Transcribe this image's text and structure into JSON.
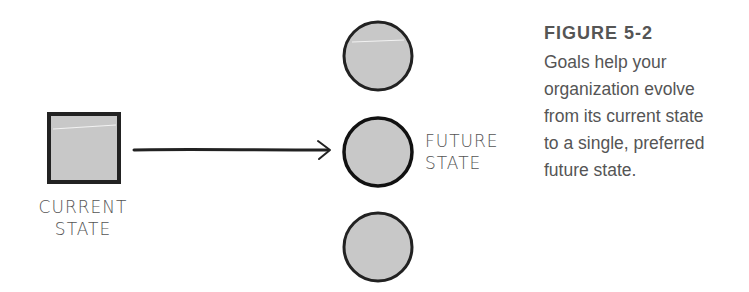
{
  "diagram": {
    "current_state": {
      "label_line1": "CURRENT",
      "label_line2": "STATE",
      "shape": "square",
      "fill": "#c8c8c8",
      "stroke": "#222222"
    },
    "arrow": {
      "direction": "right",
      "color": "#222222"
    },
    "future_states": [
      {
        "shape": "circle",
        "fill": "#c8c8c8",
        "stroke": "#222222",
        "preferred": false
      },
      {
        "shape": "circle",
        "fill": "#c8c8c8",
        "stroke": "#222222",
        "preferred": true,
        "label_line1": "FUTURE",
        "label_line2": "STATE"
      },
      {
        "shape": "circle",
        "fill": "#c8c8c8",
        "stroke": "#222222",
        "preferred": false
      }
    ]
  },
  "caption": {
    "title": "FIGURE 5-2",
    "lines": [
      "Goals help your",
      "organization evolve",
      "from its current state",
      "to a single, preferred",
      "future state."
    ]
  }
}
